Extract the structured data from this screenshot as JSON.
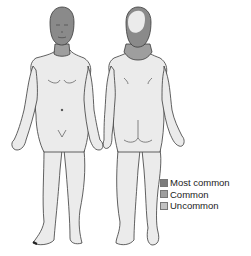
{
  "figure": {
    "views": [
      {
        "name": "anterior",
        "label": "Front view"
      },
      {
        "name": "posterior",
        "label": "Back view"
      }
    ],
    "colors": {
      "skin": "#ebebeb",
      "outline": "#3a3a3a",
      "most_common": "#7c7c7c",
      "common": "#9e9e9e",
      "uncommon": "#c2c2c2"
    }
  },
  "legend": {
    "items": [
      {
        "label": "Most common",
        "color": "#7c7c7c"
      },
      {
        "label": "Common",
        "color": "#9e9e9e"
      },
      {
        "label": "Uncommon",
        "color": "#c2c2c2"
      }
    ]
  }
}
